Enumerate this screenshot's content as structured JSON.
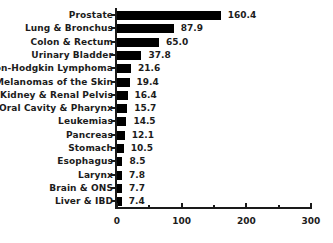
{
  "chart_data": {
    "type": "bar",
    "orientation": "horizontal",
    "title": "",
    "xlabel": "",
    "ylabel": "",
    "xlim": [
      0,
      300
    ],
    "xticks": [
      0,
      50,
      100,
      150,
      200,
      250,
      300
    ],
    "xtick_labels": [
      "0",
      "",
      "100",
      "",
      "200",
      "",
      "300"
    ],
    "grid": false,
    "legend": null,
    "bar_color": "#000000",
    "axis_color": "#1a1a1a",
    "text_color": "#1c1c1c",
    "categories": [
      "Prostate",
      "Lung & Bronchus",
      "Colon & Rectum",
      "Urinary Bladder",
      "Non-Hodgkin Lymphoma",
      "Melanomas of the Skin",
      "Kidney & Renal Pelvis",
      "Oral Cavity & Pharynx",
      "Leukemias",
      "Pancreas",
      "Stomach",
      "Esophagus",
      "Larynx",
      "Brain & ONS",
      "Liver & IBD"
    ],
    "values": [
      160.4,
      87.9,
      65.0,
      37.8,
      21.6,
      19.4,
      16.4,
      15.7,
      14.5,
      12.1,
      10.5,
      8.5,
      7.8,
      7.7,
      7.4
    ],
    "value_labels": [
      "160.4",
      "87.9",
      "65.0",
      "37.8",
      "21.6",
      "19.4",
      "16.4",
      "15.7",
      "14.5",
      "12.1",
      "10.5",
      "8.5",
      "7.8",
      "7.7",
      "7.4"
    ],
    "bars": [
      {
        "label": "Prostate",
        "value": 160.4,
        "value_label": "160.4"
      },
      {
        "label": "Lung & Bronchus",
        "value": 87.9,
        "value_label": "87.9"
      },
      {
        "label": "Colon & Rectum",
        "value": 65.0,
        "value_label": "65.0"
      },
      {
        "label": "Urinary Bladder",
        "value": 37.8,
        "value_label": "37.8"
      },
      {
        "label": "Non-Hodgkin Lymphoma",
        "value": 21.6,
        "value_label": "21.6"
      },
      {
        "label": "Melanomas of the Skin",
        "value": 19.4,
        "value_label": "19.4"
      },
      {
        "label": "Kidney & Renal Pelvis",
        "value": 16.4,
        "value_label": "16.4"
      },
      {
        "label": "Oral Cavity & Pharynx",
        "value": 15.7,
        "value_label": "15.7"
      },
      {
        "label": "Leukemias",
        "value": 14.5,
        "value_label": "14.5"
      },
      {
        "label": "Pancreas",
        "value": 12.1,
        "value_label": "12.1"
      },
      {
        "label": "Stomach",
        "value": 10.5,
        "value_label": "10.5"
      },
      {
        "label": "Esophagus",
        "value": 8.5,
        "value_label": "8.5"
      },
      {
        "label": "Larynx",
        "value": 7.8,
        "value_label": "7.8"
      },
      {
        "label": "Brain & ONS",
        "value": 7.7,
        "value_label": "7.7"
      },
      {
        "label": "Liver & IBD",
        "value": 7.4,
        "value_label": "7.4"
      }
    ]
  },
  "layout": {
    "origin_x": 117,
    "axis_y": 207,
    "plot_top": 8,
    "px_per_unit": 0.6467,
    "row_height": 13.3,
    "bar_height": 9
  }
}
